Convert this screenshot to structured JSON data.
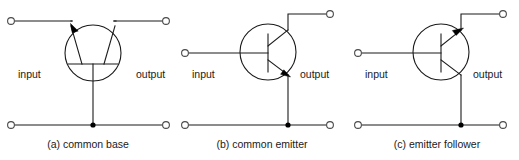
{
  "figure": {
    "type": "circuit-diagram-set",
    "background_color": "#ffffff",
    "line_color": "#1a1a1a",
    "terminal_color": "#4a4a4a",
    "junction_color": "#000000",
    "panels": [
      {
        "id": "a",
        "caption": "(a) common base",
        "input_label": "input",
        "output_label": "output",
        "orientation": "rotated-90",
        "input_terminal": "top-left",
        "output_terminal": "top-right",
        "common_terminal": "base",
        "arrow_on": "emitter",
        "arrow_direction": "inward-upper-left",
        "ground_rail_terminals": [
          "left",
          "right"
        ],
        "junction_dot": true
      },
      {
        "id": "b",
        "caption": "(b) common emitter",
        "input_label": "input",
        "output_label": "output",
        "orientation": "standard-npn",
        "input_terminal": "mid-left-base",
        "output_terminal": "top-right-collector",
        "common_terminal": "emitter",
        "arrow_on": "emitter",
        "arrow_direction": "outward-lower-right",
        "ground_rail_terminals": [
          "left",
          "right"
        ],
        "junction_dot": true
      },
      {
        "id": "c",
        "caption": "(c) emitter follower",
        "input_label": "input",
        "output_label": "output",
        "orientation": "inverted-pnp",
        "input_terminal": "mid-left-base",
        "output_terminal": "top-right",
        "common_terminal": "emitter-output",
        "arrow_on": "upper-lead",
        "arrow_direction": "outward-upper-right",
        "ground_rail_terminals": [
          "left",
          "right"
        ],
        "junction_dot": true
      }
    ]
  }
}
